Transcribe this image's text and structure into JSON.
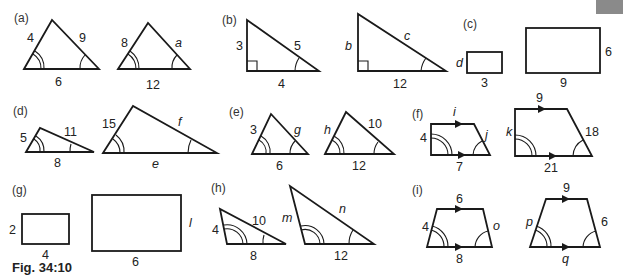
{
  "figure": {
    "caption": "Fig. 34:10",
    "corner_tab_color": "#8a8a8a"
  },
  "parts": {
    "a": {
      "label": "(a)",
      "left": {
        "sides": [
          "4",
          "9",
          "6"
        ]
      },
      "right": {
        "sides": [
          "8",
          "a",
          "12"
        ]
      }
    },
    "b": {
      "label": "(b)",
      "left": {
        "sides": [
          "3",
          "5",
          "4"
        ]
      },
      "right": {
        "sides": [
          "b",
          "c",
          "12"
        ]
      }
    },
    "c": {
      "label": "(c)",
      "left": {
        "sides": [
          "d",
          "3"
        ]
      },
      "right": {
        "sides": [
          "6",
          "9"
        ]
      }
    },
    "d": {
      "label": "(d)",
      "left": {
        "sides": [
          "5",
          "11",
          "8"
        ]
      },
      "right": {
        "sides": [
          "15",
          "f",
          "e"
        ]
      }
    },
    "e": {
      "label": "(e)",
      "left": {
        "sides": [
          "3",
          "g",
          "6"
        ]
      },
      "right": {
        "sides": [
          "h",
          "10",
          "12"
        ]
      }
    },
    "f": {
      "label": "(f)",
      "left": {
        "sides": [
          "i",
          "4",
          "j",
          "7"
        ]
      },
      "right": {
        "sides": [
          "9",
          "k",
          "18",
          "21"
        ]
      }
    },
    "g": {
      "label": "(g)",
      "left": {
        "sides": [
          "2",
          "4"
        ]
      },
      "right": {
        "sides": [
          "l",
          "6"
        ]
      }
    },
    "h": {
      "label": "(h)",
      "left": {
        "sides": [
          "4",
          "10",
          "8"
        ]
      },
      "right": {
        "sides": [
          "m",
          "n",
          "12"
        ]
      }
    },
    "i": {
      "label": "(i)",
      "left": {
        "sides": [
          "6",
          "4",
          "o",
          "8"
        ]
      },
      "right": {
        "sides": [
          "9",
          "p",
          "6",
          "q"
        ]
      }
    }
  }
}
